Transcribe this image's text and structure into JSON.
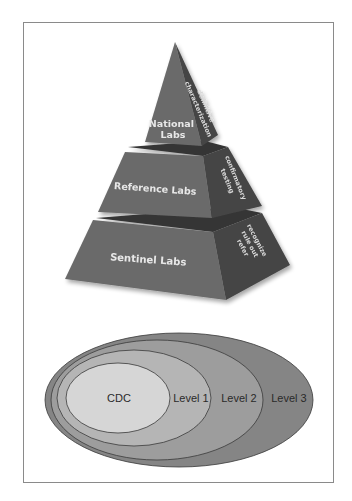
{
  "pyramid": {
    "tiers": [
      {
        "label_lines": [
          "National",
          "Labs"
        ],
        "side_lines": [
          "definitive",
          "characterization"
        ],
        "front_color": "#6b6b6b",
        "side_color": "#454545",
        "top_color": "#353535"
      },
      {
        "label_lines": [
          "Reference Labs"
        ],
        "side_lines": [
          "confirmatory",
          "testing"
        ],
        "front_color": "#6b6b6b",
        "side_color": "#454545",
        "top_color": "#353535"
      },
      {
        "label_lines": [
          "Sentinel Labs"
        ],
        "side_lines": [
          "recognize",
          "rule out",
          "refer"
        ],
        "front_color": "#6b6b6b",
        "side_color": "#454545",
        "top_color": "#353535"
      }
    ]
  },
  "ellipses": {
    "items": [
      {
        "label": "Level 3",
        "color": "#858585"
      },
      {
        "label": "Level 2",
        "color": "#9d9d9d"
      },
      {
        "label": "Level 1",
        "color": "#b5b5b5"
      },
      {
        "label": "CDC",
        "color": "#d6d6d6"
      }
    ],
    "stroke_color": "#3a3a3a"
  }
}
